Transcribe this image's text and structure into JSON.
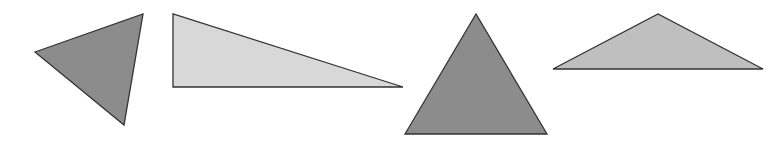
{
  "canvas": {
    "width": 771,
    "height": 144,
    "background": "#ffffff"
  },
  "stroke_color": "#333333",
  "triangles": [
    {
      "id": "triangle-1",
      "type": "scalene-acute",
      "points": "35,52 143,14 124,125",
      "fill": "#8c8c8c"
    },
    {
      "id": "triangle-2",
      "type": "right",
      "points": "173,14 173,87 403,87",
      "fill": "#d8d8d8"
    },
    {
      "id": "triangle-3",
      "type": "equilateral",
      "points": "476,14 405,134 547,134",
      "fill": "#8c8c8c"
    },
    {
      "id": "triangle-4",
      "type": "obtuse-isosceles",
      "points": "553,69 658,14 763,69",
      "fill": "#bfbfbf"
    }
  ]
}
